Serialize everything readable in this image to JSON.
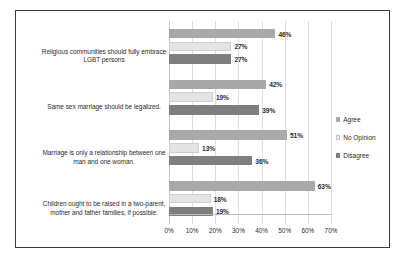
{
  "chart_data": {
    "type": "bar",
    "orientation": "horizontal",
    "title": "",
    "subtitle": "",
    "xlabel": "",
    "ylabel": "",
    "xlim": [
      0,
      70
    ],
    "xtick_labels": [
      "0%",
      "10%",
      "20%",
      "30%",
      "40%",
      "50%",
      "60%",
      "70%"
    ],
    "xtick_values": [
      0,
      10,
      20,
      30,
      40,
      50,
      60,
      70
    ],
    "grid": true,
    "legend_position": "right",
    "categories": [
      "Religious communities should fully embrace LGBT persons",
      "Same sex marriage should be legalized.",
      "Marriage is only a relationship between one man and one woman.",
      "Children ought to be raised in a two-parent, mother and father families, if possible."
    ],
    "series": [
      {
        "name": "Agree",
        "color": "#a9a9a9",
        "values": [
          46,
          42,
          51,
          63
        ],
        "value_labels": [
          "46%",
          "42%",
          "51%",
          "63%"
        ]
      },
      {
        "name": "No Opinion",
        "color": "#e4e4e4",
        "values": [
          27,
          19,
          13,
          18
        ],
        "value_labels": [
          "27%",
          "19%",
          "13%",
          "18%"
        ]
      },
      {
        "name": "Disagree",
        "color": "#7e7e7e",
        "values": [
          27,
          39,
          36,
          19
        ],
        "value_labels": [
          "27%",
          "39%",
          "36%",
          "19%"
        ]
      }
    ]
  },
  "legend": {
    "items": [
      {
        "label": "Agree",
        "swatch_class": "agree"
      },
      {
        "label": "No Opinion",
        "swatch_class": "noop"
      },
      {
        "label": "Disagree",
        "swatch_class": "disagree"
      }
    ]
  },
  "category_labels": [
    {
      "line1": "Religious communities should fully embrace",
      "line2": "LGBT persons"
    },
    {
      "line1": "Same sex marriage should be legalized.",
      "line2": ""
    },
    {
      "line1": "Marriage is only a relationship between one",
      "line2": "man and one woman."
    },
    {
      "line1": "Children ought to be raised in a two-parent,",
      "line2": "mother and father families, if possible."
    }
  ],
  "colors": {
    "agree": "#a9a9a9",
    "no_opinion": "#e4e4e4",
    "disagree": "#7e7e7e",
    "frame": "#3a3a3a",
    "gridline": "#dedede",
    "text": "#2b2b2b",
    "background": "#ffffff"
  }
}
